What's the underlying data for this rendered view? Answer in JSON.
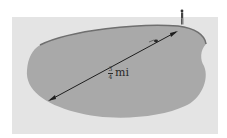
{
  "diagram": {
    "type": "lake-distance-illustration",
    "colors": {
      "background": "#e4e4e4",
      "lake_fill": "#a9a9a9",
      "lake_shore": "#6f6f6f",
      "arrow": "#1e1e1e"
    },
    "measurement": {
      "numerator": "3",
      "denominator": "4",
      "unit": "mi"
    },
    "icons": {
      "person": "person-on-shore-icon",
      "swimmer": "swimmer-icon"
    }
  }
}
